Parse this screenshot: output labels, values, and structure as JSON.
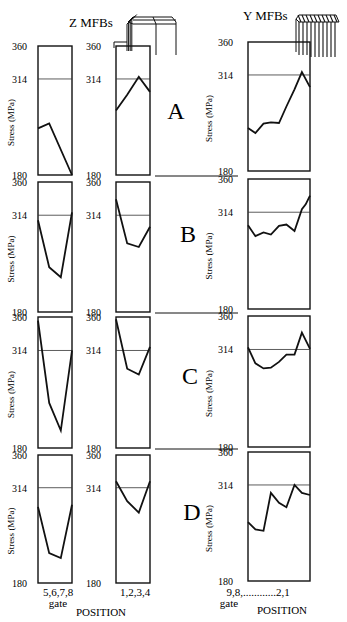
{
  "chart_data": {
    "type": "line",
    "title": "",
    "headers": {
      "z": "Z MFBs",
      "y": "Y MFBs"
    },
    "ylabel": "Stress (MPa)",
    "ylim": [
      180,
      360
    ],
    "yticks": [
      "360",
      "314",
      "180"
    ],
    "reference_line": 314,
    "row_labels": [
      "A",
      "B",
      "C",
      "D"
    ],
    "columns": [
      {
        "id": "z1",
        "xlabel": "5,6,7,8",
        "xsublabel": "gate"
      },
      {
        "id": "z2",
        "xlabel": "1,2,3,4",
        "xsublabel": ""
      },
      {
        "id": "y",
        "xlabel": "9,8,............2,1",
        "xsublabel": "gate"
      }
    ],
    "footer_labels": [
      "POSITION",
      "POSITION"
    ],
    "panels": [
      {
        "row": "A",
        "column": "z1",
        "x": [
          0,
          0.33,
          1
        ],
        "values": [
          245,
          252,
          180
        ]
      },
      {
        "row": "A",
        "column": "z2",
        "x": [
          0,
          0.33,
          0.67,
          1
        ],
        "values": [
          270,
          292,
          317,
          296
        ]
      },
      {
        "row": "A",
        "column": "y",
        "x": [
          0,
          0.12,
          0.25,
          0.37,
          0.5,
          0.62,
          0.75,
          0.87,
          1
        ],
        "values": [
          240,
          233,
          246,
          248,
          247,
          270,
          294,
          318,
          297
        ]
      },
      {
        "row": "B",
        "column": "z1",
        "x": [
          0,
          0.33,
          0.67,
          1
        ],
        "values": [
          307,
          242,
          228,
          318
        ]
      },
      {
        "row": "B",
        "column": "z2",
        "x": [
          0,
          0.33,
          0.67,
          1
        ],
        "values": [
          336,
          275,
          270,
          298
        ]
      },
      {
        "row": "B",
        "column": "y",
        "x": [
          0,
          0.12,
          0.25,
          0.37,
          0.5,
          0.62,
          0.75,
          0.87,
          0.93,
          1
        ],
        "values": [
          296,
          281,
          286,
          283,
          295,
          297,
          288,
          318,
          325,
          337
        ]
      },
      {
        "row": "C",
        "column": "z1",
        "x": [
          0,
          0.33,
          0.67,
          1
        ],
        "values": [
          355,
          242,
          204,
          314
        ]
      },
      {
        "row": "C",
        "column": "z2",
        "x": [
          0,
          0.33,
          0.67,
          1
        ],
        "values": [
          357,
          289,
          281,
          319
        ]
      },
      {
        "row": "C",
        "column": "y",
        "x": [
          0,
          0.12,
          0.25,
          0.37,
          0.5,
          0.62,
          0.75,
          0.87,
          1
        ],
        "values": [
          317,
          295,
          288,
          289,
          297,
          307,
          307,
          337,
          315
        ]
      },
      {
        "row": "D",
        "column": "z1",
        "x": [
          0,
          0.33,
          0.67,
          1
        ],
        "values": [
          287,
          222,
          215,
          290
        ]
      },
      {
        "row": "D",
        "column": "z2",
        "x": [
          0,
          0.33,
          0.67,
          1
        ],
        "values": [
          323,
          295,
          279,
          323
        ]
      },
      {
        "row": "D",
        "column": "y",
        "x": [
          0,
          0.12,
          0.25,
          0.37,
          0.5,
          0.62,
          0.75,
          0.87,
          1
        ],
        "values": [
          262,
          252,
          250,
          303,
          289,
          283,
          314,
          303,
          300
        ]
      }
    ]
  }
}
